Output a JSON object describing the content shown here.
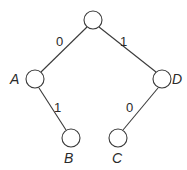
{
  "diagram": {
    "type": "binary-tree",
    "nodes": [
      {
        "id": "root",
        "label": ""
      },
      {
        "id": "A",
        "label": "A"
      },
      {
        "id": "D",
        "label": "D"
      },
      {
        "id": "B",
        "label": "B"
      },
      {
        "id": "C",
        "label": "C"
      }
    ],
    "edges": [
      {
        "from": "root",
        "to": "A",
        "label": "0"
      },
      {
        "from": "root",
        "to": "D",
        "label": "1"
      },
      {
        "from": "A",
        "to": "B",
        "label": "1"
      },
      {
        "from": "D",
        "to": "C",
        "label": "0"
      }
    ],
    "colors": {
      "stroke": "#3a3a3a",
      "text": "#2a2a2a",
      "background": "#ffffff"
    }
  }
}
